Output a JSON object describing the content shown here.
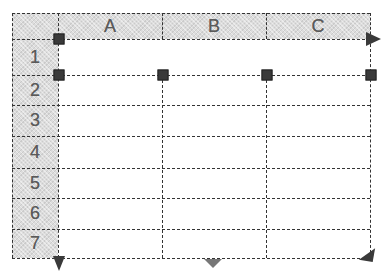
{
  "grid": {
    "columns": [
      {
        "label": "A"
      },
      {
        "label": "B"
      },
      {
        "label": "C"
      }
    ],
    "rows": [
      {
        "label": "1"
      },
      {
        "label": "2"
      },
      {
        "label": "3"
      },
      {
        "label": "4"
      },
      {
        "label": "5"
      },
      {
        "label": "6"
      },
      {
        "label": "7"
      }
    ]
  },
  "colors": {
    "header_fill": "#dcdcdc",
    "grid_line": "#333333",
    "handle": "#3a3a3a",
    "arrow_dark": "#3a3a3a",
    "arrow_light": "#777777",
    "header_text": "#5a5a5a"
  },
  "markers": {
    "handles": [
      "row1-top-left",
      "row2-top-left",
      "row2-top-B",
      "row2-top-C",
      "row2-top-right"
    ],
    "arrows": [
      "right-arrow-row1",
      "down-arrow-left",
      "down-arrow-middle",
      "diagonal-arrow-bottom-right"
    ]
  }
}
